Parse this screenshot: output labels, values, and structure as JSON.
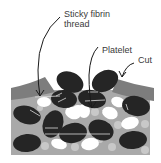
{
  "labels": {
    "fibrin_line1": "Sticky fibrin",
    "fibrin_line2": "thread",
    "platelet": "Platelet",
    "cut": "Cut"
  },
  "colors": {
    "tissue": "#a9a9a9",
    "skin": "#7d7d7d",
    "red_cell": "#252525",
    "platelet": "#ffffff",
    "small_cell": "#c8c8c8",
    "arrow": "#1a1a1a",
    "text": "#3a3a3a"
  }
}
